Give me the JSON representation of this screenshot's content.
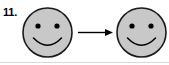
{
  "figure": {
    "label": "11.",
    "caption_text": "",
    "background_color": "#ffffff",
    "width": 169,
    "height": 65,
    "rule_color": "#d9d9d9"
  },
  "style": {
    "face_fill": "#c8c8c8",
    "outline_color": "#1a1a1a",
    "outline_width": 1.6,
    "feature_color": "#000000",
    "arrow_color": "#000000"
  },
  "faces": [
    {
      "name": "left-smiley-face",
      "expression": "smile",
      "cx": 47.5,
      "cy": 32.5,
      "r": 24.5,
      "eyes": [
        {
          "cx": 38.0,
          "cy": 26.0,
          "r": 2.6
        },
        {
          "cx": 57.0,
          "cy": 26.0,
          "r": 2.6
        }
      ],
      "mouth_path": "M 33.5 38.0 Q 47.5 52.5 61.5 38.0"
    },
    {
      "name": "right-smiley-face",
      "expression": "smile",
      "cx": 141.5,
      "cy": 32.5,
      "r": 24.5,
      "eyes": [
        {
          "cx": 132.0,
          "cy": 26.0,
          "r": 2.6
        },
        {
          "cx": 151.0,
          "cy": 26.0,
          "r": 2.6
        }
      ],
      "mouth_path": "M 127.5 38.0 Q 141.5 52.5 155.5 38.0"
    }
  ],
  "arrow": {
    "name": "right-arrow",
    "direction": "right",
    "x_start": 78,
    "x_end": 113,
    "y": 32.5,
    "line_width": 1.4,
    "head_length": 8,
    "head_width": 7
  }
}
